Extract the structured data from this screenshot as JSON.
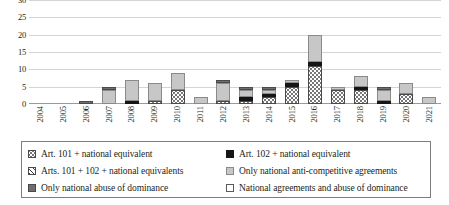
{
  "chart_data": {
    "type": "bar",
    "barmode": "stacked",
    "title": "",
    "xlabel": "",
    "ylabel": "",
    "ylim": [
      0,
      30
    ],
    "yticks": [
      0,
      5,
      10,
      15,
      20,
      25,
      30
    ],
    "grid": true,
    "legend_position": "bottom",
    "categories": [
      "2004",
      "2005",
      "2006",
      "2007",
      "2008",
      "2009",
      "2010",
      "2011",
      "2012",
      "2013",
      "2014",
      "2015",
      "2016",
      "2017",
      "2018",
      "2019",
      "2020",
      "2021"
    ],
    "series": [
      {
        "name": "Art. 101 + national equivalent",
        "pattern": "dotted",
        "color": "#ffffff",
        "values": [
          0,
          0,
          0,
          0,
          0,
          1,
          4,
          0,
          1,
          1,
          2,
          5,
          11,
          4,
          4,
          0,
          3,
          0
        ]
      },
      {
        "name": "Art. 102 + national equivalent",
        "pattern": "solid-black",
        "color": "#151515",
        "values": [
          0,
          0,
          0,
          0,
          1,
          0,
          0,
          0,
          0,
          1,
          1,
          1,
          1,
          0,
          1,
          1,
          0,
          0
        ]
      },
      {
        "name": "Arts. 101 + 102 + national equivalents",
        "pattern": "diagonal-hatch",
        "color": "#ffffff",
        "values": [
          0,
          0,
          0,
          0,
          0,
          0,
          0,
          0,
          0,
          0,
          0,
          0,
          0,
          0,
          0,
          0,
          0,
          0
        ]
      },
      {
        "name": "Only national anti-competitive agreements",
        "pattern": "light-grey",
        "color": "#c7c7c7",
        "values": [
          0,
          0,
          0,
          4,
          6,
          5,
          5,
          2,
          5,
          2,
          1,
          1,
          8,
          1,
          3,
          3,
          3,
          2
        ]
      },
      {
        "name": "Only national abuse of dominance",
        "pattern": "dark-grey",
        "color": "#6e6e6e",
        "values": [
          0,
          0,
          1,
          1,
          0,
          0,
          0,
          0,
          1,
          1,
          1,
          0,
          0,
          0,
          0,
          1,
          0,
          0
        ]
      },
      {
        "name": "National agreements  and abuse of dominance",
        "pattern": "white-outline",
        "color": "#ffffff",
        "values": [
          0,
          0,
          0,
          0,
          0,
          0,
          0,
          0,
          0,
          0,
          0,
          0,
          0,
          0,
          0,
          0,
          0,
          0
        ]
      }
    ],
    "totals": [
      0,
      0,
      1,
      5,
      7,
      6,
      9,
      2,
      7,
      5,
      5,
      7,
      20,
      5,
      8,
      5,
      6,
      2
    ]
  },
  "legend": {
    "items": [
      {
        "label": "Art. 101 + national equivalent",
        "key": "s-101"
      },
      {
        "label": "Art. 102 + national equivalent",
        "key": "s-102"
      },
      {
        "label": "Arts. 101 + 102 + national equivalents",
        "key": "s-101102"
      },
      {
        "label": "Only national anti-competitive agreements",
        "key": "s-natagr"
      },
      {
        "label": "Only national abuse of dominance",
        "key": "s-natabuse"
      },
      {
        "label": "National agreements  and abuse of dominance",
        "key": "s-natboth"
      }
    ]
  }
}
